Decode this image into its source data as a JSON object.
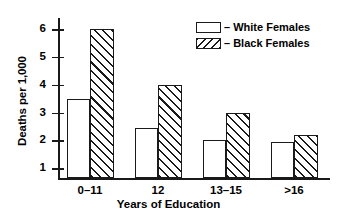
{
  "chart_data": {
    "type": "bar",
    "title": "",
    "xlabel": "Years of Education",
    "ylabel": "Deaths per 1,000",
    "categories": [
      "0–11",
      "12",
      "13–15",
      ">16"
    ],
    "series": [
      {
        "name": "White Females",
        "values": [
          3.5,
          2.45,
          2.0,
          1.95
        ],
        "fill": "open"
      },
      {
        "name": "Black Females",
        "values": [
          6.0,
          4.0,
          3.0,
          2.2
        ],
        "fill": "diagonal-hatch"
      }
    ],
    "ylim": [
      0.63,
      6.4
    ],
    "yticks": [
      1,
      2,
      3,
      4,
      5,
      6
    ],
    "ytick_labels": [
      "1",
      "2",
      "3",
      "4",
      "5",
      "6"
    ],
    "grid": false,
    "legend_position": "top-right",
    "legend_separator": "–",
    "colors": {
      "ink": "#1a1a1a",
      "background": "#ffffff"
    }
  }
}
